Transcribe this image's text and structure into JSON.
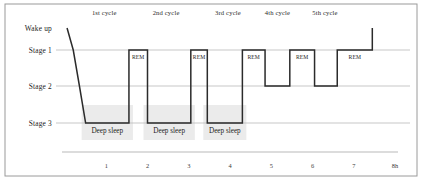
{
  "figure": {
    "frame_color": "#9a9a9a",
    "gridline_color": "#b9b9b9",
    "trace_color": "#2b2b2b",
    "band_color": "#ebebeb",
    "background": "#ffffff"
  },
  "y_axis": {
    "labels": [
      {
        "text": "Wake up",
        "level": "wake"
      },
      {
        "text": "Stage 1",
        "level": "stage1"
      },
      {
        "text": "Stage 2",
        "level": "stage2"
      },
      {
        "text": "Stage 3",
        "level": "stage3"
      }
    ]
  },
  "x_axis": {
    "ticks": [
      "1",
      "2",
      "3",
      "4",
      "5",
      "6",
      "7",
      "8h"
    ],
    "unit": "h"
  },
  "cycles": [
    {
      "label": "1st cycle",
      "center_h": 0.95
    },
    {
      "label": "2nd cycle",
      "center_h": 2.45
    },
    {
      "label": "3rd cycle",
      "center_h": 3.95
    },
    {
      "label": "4th cycle",
      "center_h": 5.15
    },
    {
      "label": "5th cycle",
      "center_h": 6.3
    }
  ],
  "rem_blocks": [
    {
      "label": "REM",
      "start_h": 1.55,
      "end_h": 2.0
    },
    {
      "label": "REM",
      "start_h": 3.05,
      "end_h": 3.45
    },
    {
      "label": "REM",
      "start_h": 4.3,
      "end_h": 4.85
    },
    {
      "label": "REM",
      "start_h": 5.45,
      "end_h": 6.05
    },
    {
      "label": "REM",
      "start_h": 6.6,
      "end_h": 7.45
    }
  ],
  "deep_sleep_blocks": [
    {
      "label": "Deep sleep",
      "start_h": 0.5,
      "end_h": 1.55
    },
    {
      "label": "Deep sleep",
      "start_h": 2.0,
      "end_h": 3.05
    },
    {
      "label": "Deep sleep",
      "start_h": 3.45,
      "end_h": 4.3
    }
  ],
  "chart_data": {
    "type": "line",
    "title": "",
    "xlabel": "",
    "ylabel": "",
    "xlim": [
      0,
      8
    ],
    "ylim_levels": [
      "wake",
      "stage1",
      "stage2",
      "stage3"
    ],
    "grid": true,
    "legend": "none",
    "series": [
      {
        "name": "Sleep stage",
        "step": "post",
        "points": [
          {
            "t": 0.05,
            "stage": "wake"
          },
          {
            "t": 0.2,
            "stage": "stage1"
          },
          {
            "t": 0.35,
            "stage": "stage2"
          },
          {
            "t": 0.5,
            "stage": "stage3"
          },
          {
            "t": 1.55,
            "stage": "stage3"
          },
          {
            "t": 1.55,
            "stage": "stage1"
          },
          {
            "t": 2.0,
            "stage": "stage1"
          },
          {
            "t": 2.0,
            "stage": "stage3"
          },
          {
            "t": 3.05,
            "stage": "stage3"
          },
          {
            "t": 3.05,
            "stage": "stage1"
          },
          {
            "t": 3.45,
            "stage": "stage1"
          },
          {
            "t": 3.45,
            "stage": "stage3"
          },
          {
            "t": 4.3,
            "stage": "stage3"
          },
          {
            "t": 4.3,
            "stage": "stage1"
          },
          {
            "t": 4.85,
            "stage": "stage1"
          },
          {
            "t": 4.85,
            "stage": "stage2"
          },
          {
            "t": 5.45,
            "stage": "stage2"
          },
          {
            "t": 5.45,
            "stage": "stage1"
          },
          {
            "t": 6.05,
            "stage": "stage1"
          },
          {
            "t": 6.05,
            "stage": "stage2"
          },
          {
            "t": 6.6,
            "stage": "stage2"
          },
          {
            "t": 6.6,
            "stage": "stage1"
          },
          {
            "t": 7.45,
            "stage": "stage1"
          },
          {
            "t": 7.45,
            "stage": "wake"
          }
        ]
      }
    ],
    "annotations": {
      "rem": [
        "REM",
        "REM",
        "REM",
        "REM",
        "REM"
      ],
      "deep_sleep": [
        "Deep sleep",
        "Deep sleep",
        "Deep sleep"
      ],
      "cycles": [
        "1st cycle",
        "2nd cycle",
        "3rd cycle",
        "4th cycle",
        "5th cycle"
      ]
    }
  },
  "geometry": {
    "plot_left": 65,
    "plot_right": 395,
    "hours_span": 8,
    "level_y": {
      "wake": 28,
      "stage1": 50,
      "stage2": 86,
      "stage3": 123
    },
    "frame": {
      "x": 5,
      "y": 4,
      "w": 412,
      "h": 172
    },
    "axis_line_y": 152,
    "axis_line_x1": 62,
    "axis_line_x2": 398,
    "tick_label_y": 168,
    "cycle_label_y": 15,
    "deep_label_y": 133,
    "rem_label_dy": 9,
    "band_top": 105,
    "band_bottom": 140
  }
}
